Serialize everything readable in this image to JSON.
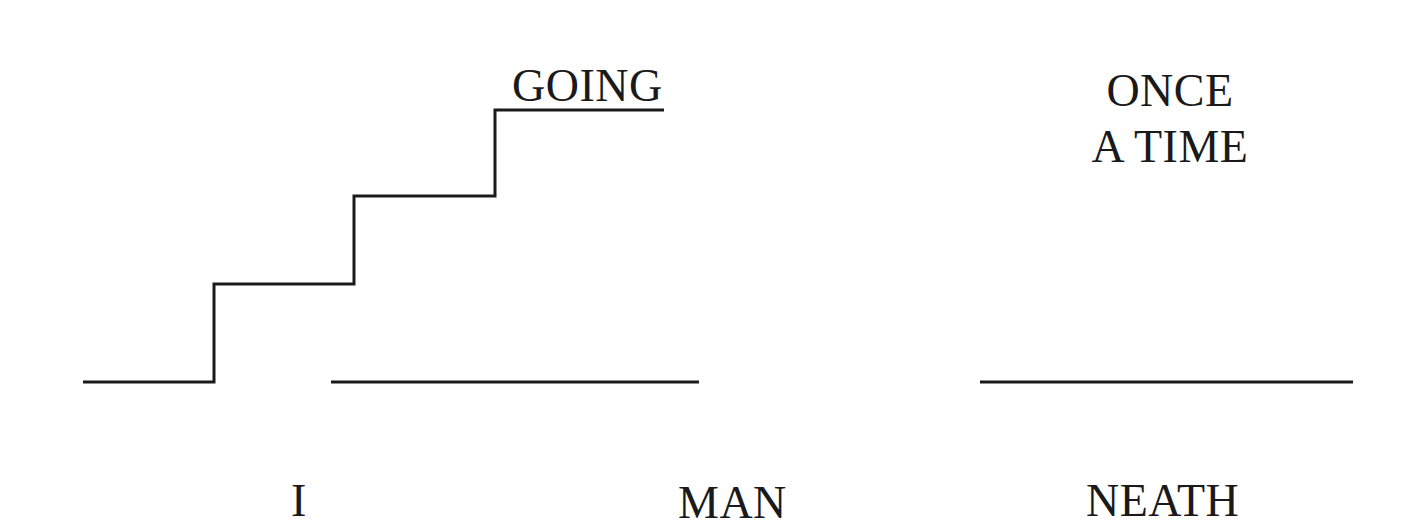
{
  "puzzles": [
    {
      "id": "staircase-puzzle",
      "words": {
        "top": "GOING",
        "bottom_left": "I",
        "bottom_right": "MAN"
      },
      "graphic": "staircase-line"
    },
    {
      "id": "once-a-time-puzzle",
      "words": {
        "top_line_1": "ONCE",
        "top_line_2": "A TIME",
        "bottom": "NEATH"
      },
      "graphic": "horizontal-line"
    }
  ],
  "colors": {
    "ink": "#1a1a1a",
    "background": "#ffffff"
  }
}
